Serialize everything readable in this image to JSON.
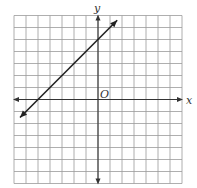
{
  "chart_data": {
    "type": "line",
    "title": "",
    "xlabel": "x",
    "ylabel": "y",
    "origin_label": "O",
    "xlim": [
      -7,
      7
    ],
    "ylim": [
      -7,
      7
    ],
    "grid": true,
    "grid_step": 1,
    "tick_labels": false,
    "series": [
      {
        "name": "line",
        "equation": "y = x + 5",
        "slope": 1,
        "y_intercept": 5,
        "x_intercept": -5,
        "arrows_both_ends": true,
        "x": [
          -6.5,
          1.6
        ],
        "y": [
          -1.5,
          6.6
        ]
      }
    ]
  },
  "labels": {
    "x_axis": "x",
    "y_axis": "y",
    "origin": "O"
  },
  "colors": {
    "grid": "#9a9a9a",
    "axis": "#333333",
    "line": "#222222",
    "background": "#ffffff"
  }
}
